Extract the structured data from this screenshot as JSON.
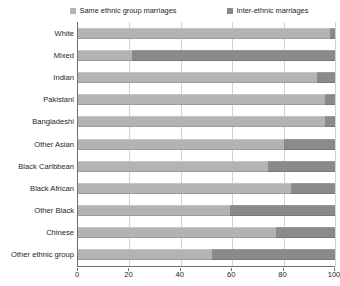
{
  "legend": {
    "position": "top",
    "items": [
      {
        "label": "Same ethnic group marriages",
        "color": "#b3b3b3",
        "icon": "legend-swatch-icon"
      },
      {
        "label": "Inter-ethnic marriages",
        "color": "#8a8a8a",
        "icon": "legend-swatch-icon"
      }
    ]
  },
  "axis": {
    "x": {
      "ticks": [
        "0",
        "20",
        "40",
        "60",
        "80",
        "100"
      ],
      "min": 0,
      "max": 100,
      "step": 20
    }
  },
  "chart_data": {
    "type": "bar",
    "orientation": "horizontal",
    "stacked": true,
    "stack_mode": "percent",
    "title": "",
    "subtitle": "",
    "xlabel": "",
    "ylabel": "",
    "xlim": [
      0,
      100
    ],
    "grid": true,
    "legend_position": "top",
    "categories": [
      "White",
      "Mixed",
      "Indian",
      "Pakistani",
      "Bangladeshi",
      "Other Asian",
      "Black Caribbean",
      "Black African",
      "Other Black",
      "Chinese",
      "Other ethnic group"
    ],
    "series": [
      {
        "name": "Same ethnic group marriages",
        "color": "#b3b3b3",
        "values": [
          98,
          21,
          93,
          96,
          96,
          80,
          74,
          83,
          59,
          77,
          52
        ]
      },
      {
        "name": "Inter-ethnic marriages",
        "color": "#8a8a8a",
        "values": [
          2,
          79,
          7,
          4,
          4,
          20,
          26,
          17,
          41,
          23,
          48
        ]
      }
    ]
  }
}
